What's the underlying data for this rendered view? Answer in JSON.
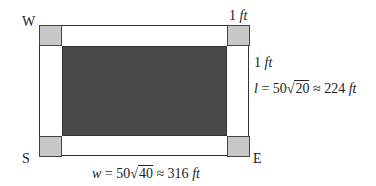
{
  "diagram": {
    "corners": {
      "nw": "W",
      "sw": "S",
      "se": "E"
    },
    "corner_dim": {
      "num": "1",
      "unit": "ft"
    },
    "side_dim": {
      "num": "1",
      "unit": "ft"
    },
    "length": {
      "var": "l",
      "eq": " = 50",
      "radicand": "20",
      "approx": " ≈ 224",
      "unit": "ft"
    },
    "width": {
      "var": "w",
      "eq": " = 50",
      "radicand": "40",
      "approx": " ≈ 316",
      "unit": "ft"
    },
    "colors": {
      "corner_fill": "#c8c8c8",
      "inner_fill": "#4a4a4a",
      "border": "#333333"
    }
  }
}
